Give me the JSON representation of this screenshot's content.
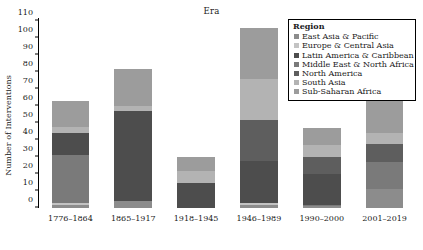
{
  "chart_data": {
    "type": "bar",
    "stacked": true,
    "title": "Era",
    "xlabel": "",
    "ylabel": "Number of Interventions",
    "ylim": [
      0,
      112
    ],
    "yticks": [
      0,
      10,
      20,
      30,
      40,
      50,
      60,
      70,
      80,
      90,
      100,
      110
    ],
    "grid": false,
    "legend_title": "Region",
    "legend_position": "top-right",
    "categories": [
      "1776–1864",
      "1865–1917",
      "1918–1945",
      "1946–1989",
      "1990–2000",
      "2001–2019"
    ],
    "series": [
      {
        "name": "East Asia & Pacific",
        "color": "#8c8c8c",
        "values": [
          2,
          4,
          0,
          2,
          1,
          11
        ]
      },
      {
        "name": "Europe & Central Asia",
        "color": "#c3c3c3",
        "values": [
          1,
          0,
          0,
          1,
          0,
          0
        ]
      },
      {
        "name": "Latin America & Caribbean",
        "color": "#4d4d4d",
        "values": [
          13,
          53,
          15,
          25,
          18,
          0
        ]
      },
      {
        "name": "Middle East & North Africa",
        "color": "#7a7a7a",
        "values": [
          28,
          0,
          0,
          0,
          1,
          16
        ]
      },
      {
        "name": "North America",
        "color": "#5e5e5e",
        "values": [
          0,
          0,
          0,
          24,
          10,
          11
        ]
      },
      {
        "name": "South Asia",
        "color": "#b3b3b3",
        "values": [
          4,
          3,
          7,
          24,
          7,
          6
        ]
      },
      {
        "name": "Sub-Saharan Africa",
        "color": "#9c9c9c",
        "values": [
          15,
          22,
          8,
          30,
          10,
          23
        ]
      }
    ],
    "totals": [
      63,
      82,
      30,
      106,
      47,
      67
    ],
    "stack_order_bottom_to_top": [
      "East Asia & Pacific",
      "Europe & Central Asia",
      "Middle East & North Africa",
      "Latin America & Caribbean",
      "North America",
      "South Asia",
      "Sub-Saharan Africa"
    ]
  }
}
